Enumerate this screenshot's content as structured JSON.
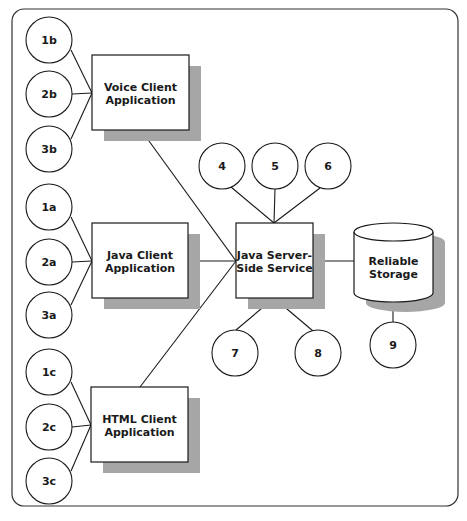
{
  "diagram": {
    "colors": {
      "stroke": "#1a1a1a",
      "shadow": "#a6a6a6",
      "fill": "#ffffff",
      "frame": "#333333"
    },
    "frame": {
      "x": 12,
      "y": 9,
      "width": 446,
      "height": 497,
      "radius": 12
    },
    "boxes": [
      {
        "id": "voice-client",
        "line1": "Voice Client",
        "line2": "Application",
        "x": 92,
        "y": 55,
        "w": 97,
        "h": 75
      },
      {
        "id": "java-client",
        "line1": "Java Client",
        "line2": "Application",
        "x": 92,
        "y": 223,
        "w": 96,
        "h": 75
      },
      {
        "id": "html-client",
        "line1": "HTML Client",
        "line2": "Application",
        "x": 91,
        "y": 387,
        "w": 97,
        "h": 75
      },
      {
        "id": "java-server",
        "line1": "Java Server-",
        "line2": "Side Service",
        "x": 236,
        "y": 223,
        "w": 77,
        "h": 75
      }
    ],
    "storage": {
      "id": "reliable-storage",
      "line1": "Reliable",
      "line2": "Storage",
      "x": 354,
      "y": 223,
      "w": 79,
      "h": 79,
      "ellipse_ry": 9
    },
    "circles": [
      {
        "label": "1b",
        "cx": 49,
        "cy": 40
      },
      {
        "label": "2b",
        "cx": 49,
        "cy": 94
      },
      {
        "label": "3b",
        "cx": 49,
        "cy": 149
      },
      {
        "label": "1a",
        "cx": 49,
        "cy": 207
      },
      {
        "label": "2a",
        "cx": 49,
        "cy": 262
      },
      {
        "label": "3a",
        "cx": 49,
        "cy": 315
      },
      {
        "label": "1c",
        "cx": 49,
        "cy": 372
      },
      {
        "label": "2c",
        "cx": 49,
        "cy": 427
      },
      {
        "label": "3c",
        "cx": 49,
        "cy": 481
      },
      {
        "label": "4",
        "cx": 222,
        "cy": 166
      },
      {
        "label": "5",
        "cx": 275,
        "cy": 166
      },
      {
        "label": "6",
        "cx": 328,
        "cy": 166
      },
      {
        "label": "7",
        "cx": 235,
        "cy": 353
      },
      {
        "label": "8",
        "cx": 318,
        "cy": 353
      },
      {
        "label": "9",
        "cx": 393,
        "cy": 345
      }
    ],
    "circle_radius": 23,
    "edges": [
      {
        "from": "1b",
        "x1": 71,
        "y1": 50,
        "x2": 92,
        "y2": 93
      },
      {
        "from": "2b",
        "x1": 72,
        "y1": 94,
        "x2": 92,
        "y2": 93
      },
      {
        "from": "3b",
        "x1": 71,
        "y1": 139,
        "x2": 92,
        "y2": 93
      },
      {
        "from": "1a",
        "x1": 71,
        "y1": 217,
        "x2": 92,
        "y2": 261
      },
      {
        "from": "2a",
        "x1": 72,
        "y1": 262,
        "x2": 92,
        "y2": 261
      },
      {
        "from": "3a",
        "x1": 71,
        "y1": 305,
        "x2": 92,
        "y2": 261
      },
      {
        "from": "1c",
        "x1": 71,
        "y1": 382,
        "x2": 91,
        "y2": 425
      },
      {
        "from": "2c",
        "x1": 72,
        "y1": 427,
        "x2": 91,
        "y2": 425
      },
      {
        "from": "3c",
        "x1": 71,
        "y1": 471,
        "x2": 91,
        "y2": 425
      },
      {
        "from": "voice-client",
        "x1": 141,
        "y1": 130,
        "x2": 236,
        "y2": 261
      },
      {
        "from": "java-client",
        "x1": 188,
        "y1": 261,
        "x2": 236,
        "y2": 261
      },
      {
        "from": "html-client",
        "x1": 140,
        "y1": 387,
        "x2": 236,
        "y2": 261
      },
      {
        "from": "4",
        "x1": 231,
        "y1": 187,
        "x2": 274,
        "y2": 223
      },
      {
        "from": "5",
        "x1": 275,
        "y1": 189,
        "x2": 274,
        "y2": 223
      },
      {
        "from": "6",
        "x1": 320,
        "y1": 188,
        "x2": 274,
        "y2": 223
      },
      {
        "from": "7",
        "x1": 236,
        "y1": 330,
        "x2": 274,
        "y2": 298
      },
      {
        "from": "8",
        "x1": 313,
        "y1": 331,
        "x2": 274,
        "y2": 298
      },
      {
        "from": "java-server",
        "x1": 313,
        "y1": 261,
        "x2": 354,
        "y2": 261
      },
      {
        "from": "9",
        "x1": 393,
        "y1": 302,
        "x2": 393,
        "y2": 322
      }
    ]
  }
}
